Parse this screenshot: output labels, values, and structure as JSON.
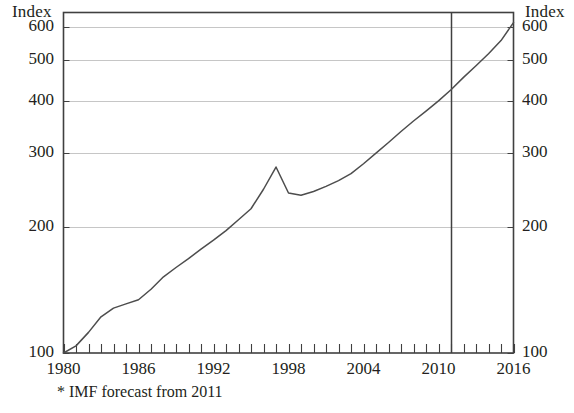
{
  "axis_titles": {
    "left": "Index",
    "right": "Index"
  },
  "footnote": "* IMF forecast from 2011",
  "chart_data": {
    "type": "line",
    "title": "",
    "subtitle": "",
    "xlabel": "",
    "ylabel": "Index",
    "y_axis_title": "Index",
    "y_axis_title_right": "Index",
    "yscale": "log",
    "ylim": [
      100,
      650
    ],
    "ytick_labels": [
      "600",
      "500",
      "400",
      "300",
      "200",
      "100"
    ],
    "yticks": [
      600,
      500,
      400,
      300,
      200,
      100
    ],
    "grid": true,
    "gridlines_at": [
      600,
      500,
      400,
      300,
      200
    ],
    "xlim": [
      1980,
      2016
    ],
    "xtick_labels": [
      "1980",
      "1986",
      "1992",
      "1998",
      "2004",
      "2010",
      "2016"
    ],
    "xticks": [
      1980,
      1986,
      1992,
      1998,
      2004,
      2010,
      2016
    ],
    "xtick_minor_step": 1,
    "legend": [],
    "legend_position": "none",
    "annotations": [
      {
        "name": "forecast-divider",
        "type": "vline",
        "x": 2011,
        "label": "* IMF forecast from 2011"
      }
    ],
    "series": [
      {
        "name": "Index",
        "color": "#4d4d4d",
        "x": [
          1980,
          1981,
          1982,
          1983,
          1984,
          1985,
          1986,
          1987,
          1988,
          1989,
          1990,
          1991,
          1992,
          1993,
          1994,
          1995,
          1996,
          1997,
          1998,
          1999,
          2000,
          2001,
          2002,
          2003,
          2004,
          2005,
          2006,
          2007,
          2008,
          2009,
          2010,
          2011,
          2012,
          2013,
          2014,
          2015,
          2016
        ],
        "values": [
          100,
          104,
          112,
          122,
          128,
          131,
          134,
          142,
          152,
          160,
          168,
          177,
          186,
          196,
          208,
          221,
          246,
          278,
          241,
          238,
          243,
          250,
          258,
          268,
          283,
          300,
          318,
          338,
          358,
          378,
          400,
          425,
          455,
          485,
          518,
          557,
          615
        ]
      }
    ]
  }
}
